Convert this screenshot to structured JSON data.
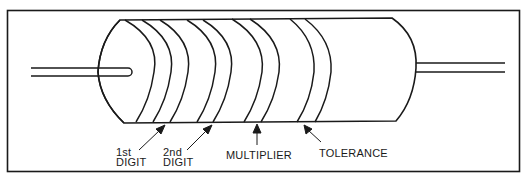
{
  "diagram": {
    "labels": {
      "first_digit": {
        "line1": "1st",
        "line2": "DIGIT"
      },
      "second_digit": {
        "line1": "2nd",
        "line2": "DIGIT"
      },
      "multiplier": "MULTIPLIER",
      "tolerance": "TOLERANCE"
    },
    "bands": [
      {
        "name": "1st digit",
        "arcs": 2
      },
      {
        "name": "2nd digit",
        "arcs": 2
      },
      {
        "name": "multiplier",
        "arcs": 2
      },
      {
        "name": "tolerance",
        "arcs": 2
      }
    ],
    "colors": {
      "line": "#1a1a1a",
      "background": "#ffffff"
    }
  }
}
